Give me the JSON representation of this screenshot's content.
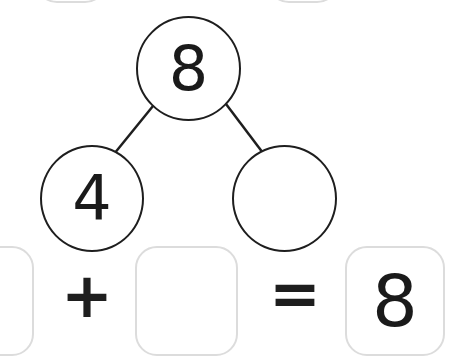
{
  "number_bond": {
    "whole": "8",
    "part_left": "4",
    "part_right": ""
  },
  "equation": {
    "addend_1": "",
    "operator_plus": "+",
    "addend_2": "",
    "operator_equals": "=",
    "sum": "8"
  },
  "colors": {
    "stroke": "#1e1e1e",
    "box_border": "#dcdcdc",
    "background": "#ffffff"
  }
}
